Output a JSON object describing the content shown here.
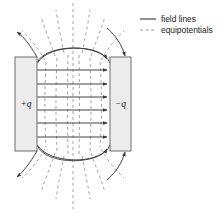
{
  "figure": {
    "background_color": "#ffffff"
  },
  "legend": {
    "position": "top-right",
    "items": [
      {
        "label": "field lines",
        "style": "solid",
        "color": "#3a3a3a",
        "icon": "solid-line-swatch"
      },
      {
        "label": "equipotentials",
        "style": "dashed",
        "color": "#8d8d8d",
        "icon": "dashed-line-swatch"
      }
    ]
  },
  "plates": [
    {
      "name": "positive-plate",
      "label": "+q",
      "charge_sign": "+",
      "fill_color": "#ececec",
      "stroke_color": "#6e6e6e",
      "x": 15,
      "y": 57,
      "width": 22,
      "height": 94
    },
    {
      "name": "negative-plate",
      "label": "−q",
      "charge_sign": "−",
      "fill_color": "#ececec",
      "stroke_color": "#6e6e6e",
      "x": 110,
      "y": 57,
      "width": 21,
      "height": 94
    }
  ],
  "field_lines": {
    "color": "#3a3a3a",
    "direction": "left-to-right",
    "interior_count": 6,
    "interior_y": [
      70,
      84,
      97,
      110,
      123,
      137
    ],
    "fringe_count": 6,
    "arrow_head": "filled-triangle"
  },
  "equipotentials": {
    "color": "#9a9a9a",
    "style": "dashed",
    "dash_pattern": "3 3",
    "interior_count": 5,
    "interior_x": [
      46,
      57,
      68,
      79,
      90
    ],
    "center_line_x": 73,
    "outer_radiating_count": 12
  },
  "boundary_curve": {
    "name": "outer-field-boundary",
    "color": "#4a4a4a",
    "description": "solid oval bulge connecting plate edges"
  },
  "colors": {
    "ink": "#1a1a1a",
    "field": "#3a3a3a",
    "equipotential": "#9a9a9a",
    "plate_fill": "#ececec",
    "plate_stroke": "#6e6e6e"
  }
}
